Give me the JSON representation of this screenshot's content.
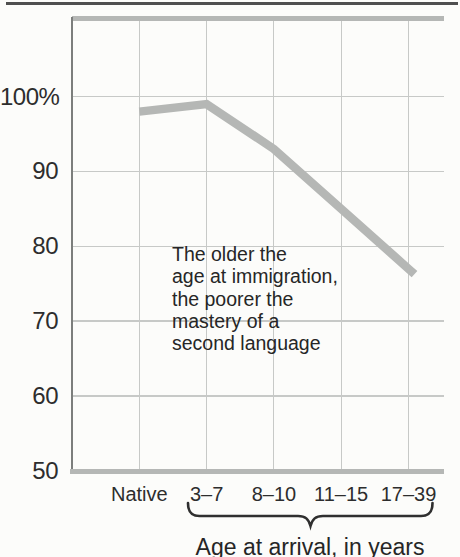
{
  "chart_data": {
    "type": "line",
    "categories": [
      "Native",
      "3–7",
      "8–10",
      "11–15",
      "17–39"
    ],
    "values": [
      98,
      99,
      93,
      85,
      77
    ],
    "series": [
      {
        "name": "Percent mastery of second language",
        "values": [
          98,
          99,
          93,
          85,
          77
        ]
      }
    ],
    "yticks": [
      {
        "label": "100%",
        "value": 100
      },
      {
        "label": "90",
        "value": 90
      },
      {
        "label": "80",
        "value": 80
      },
      {
        "label": "70",
        "value": 70
      },
      {
        "label": "60",
        "value": 60
      },
      {
        "label": "50",
        "value": 50
      }
    ],
    "ylim": [
      50,
      110.5
    ],
    "grid": true,
    "legend_position": "none",
    "title": "",
    "ylabel": "",
    "xlabel": "Age at arrival, in years",
    "annotation": "The older the\nage at immigration,\nthe poorer the\nmastery of a\nsecond language",
    "brace_span_categories": [
      "3–7",
      "17–39"
    ],
    "colors": {
      "line": "#b5b7b5",
      "grid": "#c7c9c7",
      "axis": "#7c7e7c",
      "text": "#2d2d2d",
      "page_rule": "#4f4f4f",
      "background": "#fcfcfa"
    }
  }
}
